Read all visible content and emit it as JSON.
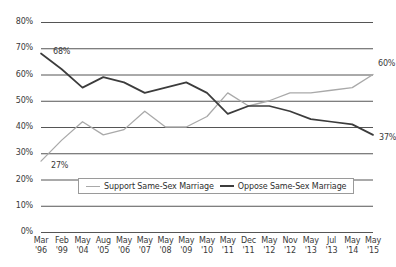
{
  "chart_data": {
    "type": "line",
    "title": "",
    "xlabel": "",
    "ylabel": "",
    "ylim": [
      0,
      80
    ],
    "ytick_step": 10,
    "grid": true,
    "legend_position": "inside-bottom-center",
    "ytick_labels": [
      "80%",
      "70%",
      "60%",
      "50%",
      "40%",
      "30%",
      "20%",
      "10%",
      "0%"
    ],
    "categories": [
      "Mar '96",
      "Feb '99",
      "May '04",
      "Aug '05",
      "May '06",
      "May '07",
      "May '08",
      "May '09",
      "May '10",
      "May '11",
      "Dec '11",
      "May '12",
      "Nov '12",
      "May '13",
      "Jul '13",
      "May '14",
      "May '15"
    ],
    "category_months": [
      "Mar",
      "Feb",
      "May",
      "Aug",
      "May",
      "May",
      "May",
      "May",
      "May",
      "May",
      "Dec",
      "May",
      "Nov",
      "May",
      "Jul",
      "May",
      "May"
    ],
    "category_years": [
      "'96",
      "'99",
      "'04",
      "'05",
      "'06",
      "'07",
      "'08",
      "'09",
      "'10",
      "'11",
      "'11",
      "'12",
      "'12",
      "'13",
      "'13",
      "'14",
      "'15"
    ],
    "series": [
      {
        "name": "Support Same-Sex Marriage",
        "color": "#a9a9a9",
        "values": [
          27,
          35,
          42,
          37,
          39,
          46,
          40,
          40,
          44,
          53,
          48,
          50,
          53,
          53,
          54,
          55,
          60
        ]
      },
      {
        "name": "Oppose Same-Sex Marriage",
        "color": "#3c3c3c",
        "values": [
          68,
          62,
          55,
          59,
          57,
          53,
          55,
          57,
          53,
          45,
          48,
          48,
          46,
          43,
          42,
          41,
          37
        ]
      }
    ],
    "annotations": [
      {
        "text": "68%",
        "series": "Oppose Same-Sex Marriage",
        "category": "Mar '96",
        "value": 68
      },
      {
        "text": "27%",
        "series": "Support Same-Sex Marriage",
        "category": "Mar '96",
        "value": 27
      },
      {
        "text": "60%",
        "series": "Support Same-Sex Marriage",
        "category": "May '15",
        "value": 60
      },
      {
        "text": "37%",
        "series": "Oppose Same-Sex Marriage",
        "category": "May '15",
        "value": 37
      }
    ]
  },
  "legend": {
    "items": [
      {
        "label": "Support Same-Sex Marriage"
      },
      {
        "label": "Oppose Same-Sex Marriage"
      }
    ]
  }
}
